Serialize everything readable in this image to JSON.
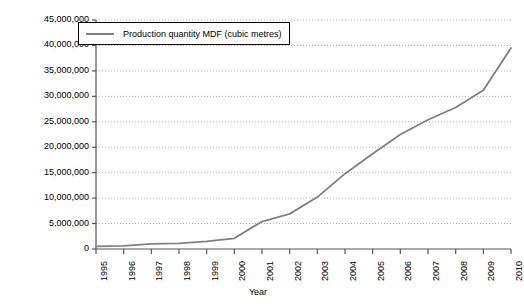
{
  "chart_data": {
    "type": "line",
    "title": "",
    "subtitle": "",
    "xlabel": "Year",
    "ylabel": "",
    "x": [
      1995,
      1996,
      1997,
      1998,
      1999,
      2000,
      2001,
      2002,
      2003,
      2004,
      2005,
      2006,
      2007,
      2008,
      2009,
      2010
    ],
    "categories": [
      "1995",
      "1996",
      "1997",
      "1998",
      "1999",
      "2000",
      "2001",
      "2002",
      "2003",
      "2004",
      "2005",
      "2006",
      "2007",
      "2008",
      "2009",
      "2010"
    ],
    "series": [
      {
        "name": "Production quantity MDF (cubic metres)",
        "color": "#808080",
        "values": [
          500000,
          600000,
          1000000,
          1100000,
          1500000,
          2100000,
          5400000,
          6900000,
          10200000,
          14800000,
          18700000,
          22500000,
          25400000,
          27800000,
          31200000,
          39500000
        ]
      }
    ],
    "xlim": [
      1995,
      2010
    ],
    "ylim": [
      0,
      45000000
    ],
    "ytick_values": [
      0,
      5000000,
      10000000,
      15000000,
      20000000,
      25000000,
      30000000,
      35000000,
      40000000,
      45000000
    ],
    "ytick_labels": [
      "0",
      "5,000,000",
      "10,000,000",
      "15,000,000",
      "20,000,000",
      "25,000,000",
      "30,000,000",
      "35,000,000",
      "40,000,000",
      "45,000,000"
    ],
    "grid": true,
    "grid_axis": "y",
    "grid_style": "dotted",
    "grid_color": "#b0b0b0",
    "legend_position": "top-left",
    "legend_entries": [
      "Production quantity MDF (cubic metres)"
    ],
    "axis_color": "#555555",
    "background": "#ffffff"
  },
  "legend": {
    "label": "Production quantity MDF (cubic metres)"
  },
  "axes": {
    "x_title": "Year"
  }
}
